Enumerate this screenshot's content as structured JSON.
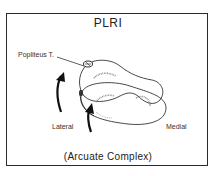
{
  "diagram": {
    "title": "PLRI",
    "labels": {
      "popliteus": "Popliteus T.",
      "lateral": "Lateral",
      "medial": "Medial"
    },
    "caption": "(Arcuate Complex)",
    "colors": {
      "stroke": "#1a1a1a",
      "frame": "#2a2a2a",
      "hatch": "#888888"
    }
  }
}
